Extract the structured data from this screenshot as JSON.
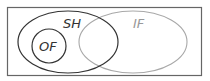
{
  "diagram": {
    "type": "venn",
    "sets": [
      {
        "id": "SH",
        "label": "SH",
        "color": "#333333"
      },
      {
        "id": "IF",
        "label": "IF",
        "color": "#999999"
      },
      {
        "id": "OF",
        "label": "OF",
        "color": "#333333",
        "subset_of": "SH"
      }
    ],
    "frame_color": "#555555",
    "background": "#ffffff"
  }
}
